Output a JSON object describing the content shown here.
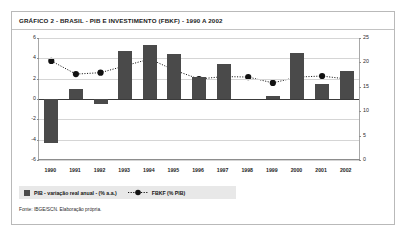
{
  "figure": {
    "title": "GRÁFICO 2 - BRASIL - PIB E INVESTIMENTO (FBKF) - 1990 A 2002",
    "source": "Fonte: IBGE/SCN. Elaboração própria.",
    "colors": {
      "bar": "#4a4a4a",
      "line": "#1a1a1a",
      "marker": "#111111",
      "grid": "#d5d5d5",
      "axis": "#8d8d8d",
      "legend_background": "#e8e8e8",
      "frame": "#b9b9b9"
    }
  },
  "legend": {
    "items": [
      {
        "label": "PIB - variação real anual - (% a.a.)",
        "marker": "square-swatch"
      },
      {
        "label": "FBKF (% PIB)",
        "marker": "dotted-line-circle"
      }
    ]
  },
  "chart_data": {
    "type": "bar",
    "title": "GRÁFICO 2 - BRASIL - PIB E INVESTIMENTO (FBKF) - 1990 A 2002",
    "xlabel": "",
    "ylabel": "",
    "grid": true,
    "legend_position": "bottom-left",
    "categories": [
      "1990",
      "1991",
      "1992",
      "1993",
      "1994",
      "1995",
      "1996",
      "1997",
      "1998",
      "1999",
      "2000",
      "2001",
      "2002"
    ],
    "axes": {
      "left": {
        "label": "PIB - variação real anual - (% a.a.)",
        "ylim": [
          -6,
          6
        ],
        "ticks": [
          6,
          4,
          2,
          0,
          -2,
          -4,
          -6
        ],
        "tick_labels": [
          "6",
          "4",
          "2",
          "0",
          "-2",
          "-4",
          "-6"
        ]
      },
      "right": {
        "label": "FBKF (% PIB)",
        "ylim": [
          0,
          25
        ],
        "ticks": [
          25,
          20,
          15,
          10,
          5,
          0
        ],
        "tick_labels": [
          "25",
          "20",
          "15",
          "10",
          "5",
          "0"
        ]
      }
    },
    "series": [
      {
        "name": "PIB - variação real anual - (% a.a.)",
        "type": "bar",
        "axis": "left",
        "values": [
          -4.3,
          1.0,
          -0.5,
          4.7,
          5.3,
          4.4,
          2.2,
          3.4,
          0.0,
          0.3,
          4.5,
          1.5,
          2.8
        ]
      },
      {
        "name": "FBKF (% PIB)",
        "type": "line",
        "axis": "right",
        "values": [
          20.3,
          17.6,
          17.9,
          19.3,
          20.7,
          18.4,
          16.6,
          17.1,
          17.0,
          15.8,
          17.0,
          17.2,
          16.6
        ]
      }
    ]
  }
}
